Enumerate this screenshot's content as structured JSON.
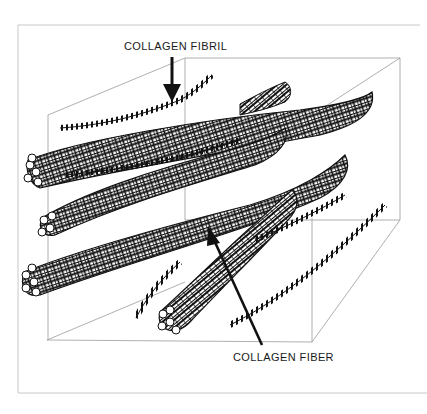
{
  "diagram": {
    "labels": {
      "fibril": "COLLAGEN FIBRIL",
      "fiber": "COLLAGEN FIBER"
    },
    "colors": {
      "ink": "#111111",
      "box_line": "#9a9a9a",
      "frame_line": "#c8c8c8",
      "background": "#ffffff"
    }
  }
}
